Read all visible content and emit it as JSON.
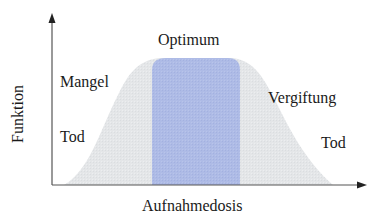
{
  "diagram": {
    "type": "dose-response plateau curve",
    "y_axis_label": "Funktion",
    "x_axis_label": "Aufnahmedosis",
    "regions": {
      "optimum": "Optimum",
      "deficiency": "Mangel",
      "death_left": "Tod",
      "toxicity": "Vergiftung",
      "death_right": "Tod"
    },
    "colors": {
      "curve_fill": "#e4e6e8",
      "optimum_fill": "#aebbe6",
      "axis": "#555555",
      "text": "#1a1a1a"
    }
  }
}
